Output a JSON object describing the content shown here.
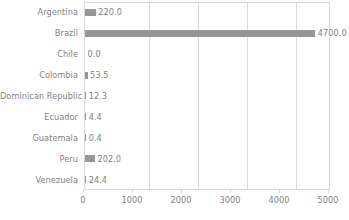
{
  "chart_data": {
    "type": "bar",
    "orientation": "horizontal",
    "title": "",
    "subtitle": "",
    "xlabel": "",
    "ylabel": "",
    "categories": [
      "Argentina",
      "Brazil",
      "Chile",
      "Colombia",
      "Dominican Republic",
      "Ecuador",
      "Guatemala",
      "Peru",
      "Venezuela"
    ],
    "values": [
      220.0,
      4700.0,
      0.0,
      53.5,
      12.3,
      4.4,
      0.4,
      202.0,
      24.4
    ],
    "data_labels": [
      "220.0",
      "4700.0",
      "0.0",
      "53.5",
      "12.3",
      "4.4",
      "0.4",
      "202.0",
      "24.4"
    ],
    "xlim": [
      0,
      5000
    ],
    "xticks": [
      0,
      1000,
      2000,
      3000,
      4000,
      5000
    ],
    "xtick_labels": [
      "0",
      "1000",
      "2000",
      "3000",
      "4000",
      "5000"
    ],
    "grid": "vertical",
    "legend": "none",
    "bar_color": "#969696",
    "gridline_color": "#d9d9d9",
    "text_color": "#7f7f7f",
    "background_color": "#ffffff"
  }
}
